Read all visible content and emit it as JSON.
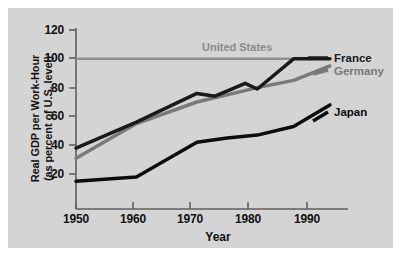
{
  "chart_data": {
    "type": "line",
    "title": "",
    "xlabel": "Year",
    "ylabel": "Real GDP per Work-Hour (as percent of U.S. level)",
    "ylabel_line1": "Real GDP per Work-Hour",
    "ylabel_line2": "(as percent of U.S. level)",
    "xlim": [
      1950,
      1995
    ],
    "ylim": [
      0,
      125
    ],
    "yticks": [
      20,
      40,
      60,
      80,
      100,
      120
    ],
    "ytick_labels": [
      "20",
      "40",
      "60",
      "80",
      "100",
      "120"
    ],
    "xticks": [
      1950,
      1960,
      1970,
      1980,
      1990
    ],
    "xtick_labels": [
      "1950",
      "1960",
      "1970",
      "1980",
      "1990"
    ],
    "grid": false,
    "legend_position": "inline-right",
    "annotations": [
      {
        "text": "United States",
        "x": 1975,
        "y": 107,
        "color": "#8a8a8a"
      }
    ],
    "series": [
      {
        "name": "United States",
        "color": "#8f8f8f",
        "width": 2.5,
        "x": [
          1950,
          1992
        ],
        "values": [
          100,
          100
        ]
      },
      {
        "name": "France",
        "color": "#1a1a1a",
        "width": 3.5,
        "x": [
          1950,
          1960,
          1970,
          1973,
          1978,
          1980,
          1986,
          1992
        ],
        "values": [
          38,
          56,
          76,
          74,
          83,
          79,
          100,
          100
        ]
      },
      {
        "name": "Germany",
        "color": "#7a7a7a",
        "width": 3.5,
        "x": [
          1950,
          1960,
          1970,
          1980,
          1986,
          1992
        ],
        "values": [
          31,
          55,
          70,
          80,
          85,
          95
        ]
      },
      {
        "name": "Japan",
        "color": "#0d0d0d",
        "width": 3.5,
        "x": [
          1950,
          1960,
          1970,
          1975,
          1980,
          1986,
          1992
        ],
        "values": [
          15,
          18,
          42,
          45,
          47,
          53,
          68
        ]
      }
    ],
    "series_labels": [
      {
        "name": "France",
        "text": "France",
        "color": "#1a1a1a",
        "x": 326,
        "y": 55
      },
      {
        "name": "Germany",
        "text": "Germany",
        "color": "#7a7a7a",
        "x": 326,
        "y": 67
      },
      {
        "name": "Japan",
        "text": "Japan",
        "color": "#0d0d0d",
        "x": 326,
        "y": 105
      }
    ],
    "colors": {
      "panel_background": "#d4d4d4",
      "page_background": "#ffffff",
      "axis": "#5a5a5a",
      "text": "#111111",
      "united_states": "#8f8f8f",
      "france": "#1a1a1a",
      "germany": "#7a7a7a",
      "japan": "#0d0d0d"
    }
  }
}
